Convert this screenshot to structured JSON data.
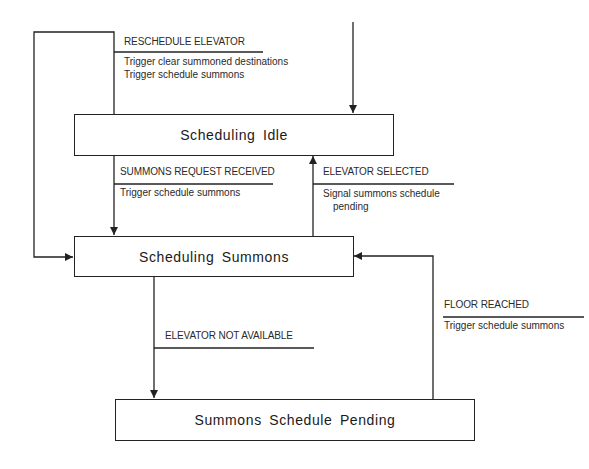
{
  "states": [
    {
      "id": "idle",
      "label": "Scheduling Idle"
    },
    {
      "id": "summons",
      "label": "Scheduling Summons"
    },
    {
      "id": "pending",
      "label": "Summons Schedule Pending"
    }
  ],
  "transitions": [
    {
      "id": "reschedule",
      "event": "RESCHEDULE ELEVATOR",
      "actions": [
        "Trigger clear summoned destinations",
        "Trigger schedule summons"
      ],
      "from": "idle",
      "to": "summons"
    },
    {
      "id": "summons-request",
      "event": "SUMMONS REQUEST RECEIVED",
      "actions": [
        "Trigger schedule summons"
      ],
      "from": "idle",
      "to": "summons"
    },
    {
      "id": "elevator-selected",
      "event": "ELEVATOR SELECTED",
      "actions": [
        "Signal summons schedule",
        "pending"
      ],
      "from": "summons",
      "to": "idle"
    },
    {
      "id": "elevator-not-available",
      "event": "ELEVATOR NOT AVAILABLE",
      "actions": [],
      "from": "summons",
      "to": "pending"
    },
    {
      "id": "floor-reached",
      "event": "FLOOR REACHED",
      "actions": [
        "Trigger schedule summons"
      ],
      "from": "pending",
      "to": "summons"
    }
  ],
  "initial_transition": {
    "to": "idle"
  },
  "colors": {
    "line": "#222222",
    "text": "#2a2a2a",
    "background": "#ffffff"
  }
}
